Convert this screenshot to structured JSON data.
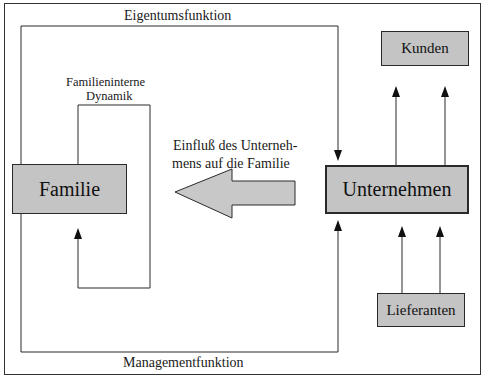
{
  "diagram": {
    "nodes": {
      "familie": "Familie",
      "unternehmen": "Unternehmen",
      "kunden": "Kunden",
      "lieferanten": "Lieferanten"
    },
    "labels": {
      "eigentumsfunktion": "Eigentumsfunktion",
      "managementfunktion": "Managementfunktion",
      "dynamik_line1": "Familieninterne",
      "dynamik_line2": "Dynamik",
      "einfluss_line1": "Einfluß des Unterneh-",
      "einfluss_line2": "mens auf die Familie"
    },
    "edges": [
      {
        "from": "Familie",
        "to": "Unternehmen",
        "label": "Eigentumsfunktion"
      },
      {
        "from": "Familie",
        "to": "Unternehmen",
        "label": "Managementfunktion"
      },
      {
        "from": "Familie",
        "to": "Familie",
        "label": "Familieninterne Dynamik"
      },
      {
        "from": "Unternehmen",
        "to": "Familie",
        "label": "Einfluß des Unternehmens auf die Familie"
      },
      {
        "from": "Unternehmen",
        "to": "Kunden",
        "count": 2
      },
      {
        "from": "Lieferanten",
        "to": "Unternehmen",
        "count": 2
      }
    ],
    "colors": {
      "box_fill": "#c4c4c4",
      "line": "#2a2a2a",
      "arrow_fill": "#c8c8c8"
    }
  }
}
